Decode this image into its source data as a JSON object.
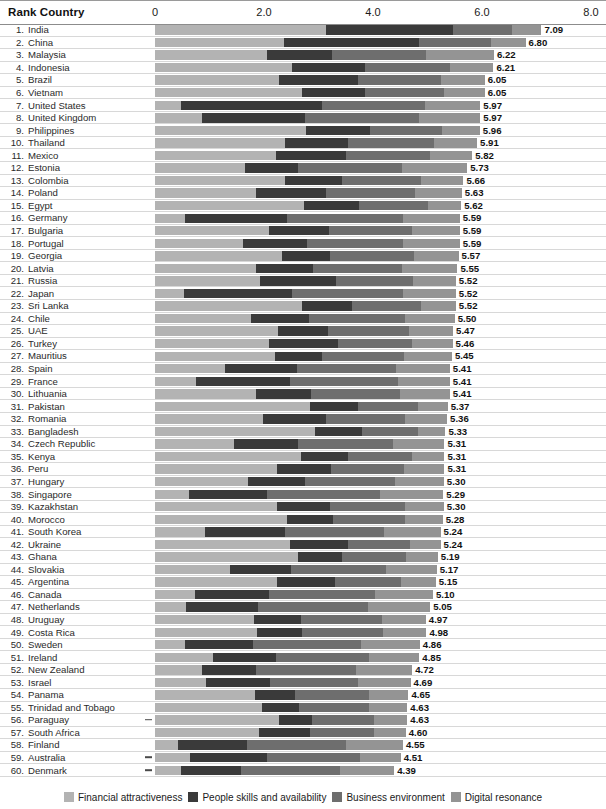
{
  "header": {
    "title": "Rank Country",
    "axis_ticks": [
      "0",
      "2.0",
      "4.0",
      "6.0",
      "8.0"
    ]
  },
  "legend": {
    "items": [
      {
        "label": "Financial attractiveness",
        "color": "#b3b3b3"
      },
      {
        "label": "People skills and availability",
        "color": "#3a3a3a"
      },
      {
        "label": "Business environment",
        "color": "#6e6e6e"
      },
      {
        "label": "Digital resonance",
        "color": "#949494"
      }
    ]
  },
  "chart_data": {
    "type": "bar",
    "title": "Rank Country",
    "subtitle": "",
    "xlabel": "",
    "ylabel": "",
    "orientation": "horizontal",
    "stacked": true,
    "xlim": [
      0,
      8.0
    ],
    "xticks": [
      0,
      2.0,
      4.0,
      6.0,
      8.0
    ],
    "grid": false,
    "legend_position": "bottom",
    "series": [
      {
        "name": "Financial attractiveness",
        "color": "#b3b3b3"
      },
      {
        "name": "People skills and availability",
        "color": "#3a3a3a"
      },
      {
        "name": "Business environment",
        "color": "#6e6e6e"
      },
      {
        "name": "Digital resonance",
        "color": "#949494"
      }
    ],
    "categories": [
      "India",
      "China",
      "Malaysia",
      "Indonesia",
      "Brazil",
      "Vietnam",
      "United States",
      "United Kingdom",
      "Philippines",
      "Thailand",
      "Mexico",
      "Estonia",
      "Colombia",
      "Poland",
      "Egypt",
      "Germany",
      "Bulgaria",
      "Portugal",
      "Georgia",
      "Latvia",
      "Russia",
      "Japan",
      "Sri Lanka",
      "Chile",
      "UAE",
      "Turkey",
      "Mauritius",
      "Spain",
      "France",
      "Lithuania",
      "Pakistan",
      "Romania",
      "Bangladesh",
      "Czech Republic",
      "Kenya",
      "Peru",
      "Hungary",
      "Singapore",
      "Kazakhstan",
      "Morocco",
      "South Korea",
      "Ukraine",
      "Ghana",
      "Slovakia",
      "Argentina",
      "Canada",
      "Netherlands",
      "Uruguay",
      "Costa Rica",
      "Sweden",
      "Ireland",
      "New Zealand",
      "Israel",
      "Panama",
      "Trinidad and Tobago",
      "Paraguay",
      "South Africa",
      "Finland",
      "Australia",
      "Denmark"
    ],
    "rows": [
      {
        "rank": 1,
        "country": "India",
        "total": "7.09",
        "segments": [
          3.13,
          2.33,
          1.09,
          0.54
        ],
        "negative": false
      },
      {
        "rank": 2,
        "country": "China",
        "total": "6.80",
        "segments": [
          2.37,
          2.48,
          1.31,
          0.64
        ],
        "negative": false
      },
      {
        "rank": 3,
        "country": "Malaysia",
        "total": "6.22",
        "segments": [
          2.06,
          1.19,
          1.73,
          1.24
        ],
        "negative": false
      },
      {
        "rank": 4,
        "country": "Indonesia",
        "total": "6.21",
        "segments": [
          2.51,
          1.35,
          1.55,
          0.8
        ],
        "negative": false
      },
      {
        "rank": 5,
        "country": "Brazil",
        "total": "6.05",
        "segments": [
          2.27,
          1.45,
          1.52,
          0.81
        ],
        "negative": false
      },
      {
        "rank": 6,
        "country": "Vietnam",
        "total": "6.05",
        "segments": [
          2.7,
          1.16,
          1.45,
          0.74
        ],
        "negative": false
      },
      {
        "rank": 7,
        "country": "United States",
        "total": "5.97",
        "segments": [
          0.47,
          2.6,
          1.89,
          1.01
        ],
        "negative": false
      },
      {
        "rank": 8,
        "country": "United Kingdom",
        "total": "5.97",
        "segments": [
          0.86,
          1.9,
          2.09,
          1.12
        ],
        "negative": false
      },
      {
        "rank": 9,
        "country": "Philippines",
        "total": "5.96",
        "segments": [
          2.77,
          1.17,
          1.32,
          0.7
        ],
        "negative": false
      },
      {
        "rank": 10,
        "country": "Thailand",
        "total": "5.91",
        "segments": [
          2.38,
          1.16,
          1.58,
          0.79
        ],
        "negative": false
      },
      {
        "rank": 11,
        "country": "Mexico",
        "total": "5.82",
        "segments": [
          2.22,
          1.29,
          1.53,
          0.78
        ],
        "negative": false
      },
      {
        "rank": 12,
        "country": "Estonia",
        "total": "5.73",
        "segments": [
          1.65,
          0.98,
          1.9,
          1.2
        ],
        "negative": false
      },
      {
        "rank": 13,
        "country": "Colombia",
        "total": "5.66",
        "segments": [
          2.39,
          1.05,
          1.44,
          0.78
        ],
        "negative": false
      },
      {
        "rank": 14,
        "country": "Poland",
        "total": "5.63",
        "segments": [
          1.85,
          1.29,
          1.63,
          0.86
        ],
        "negative": false
      },
      {
        "rank": 15,
        "country": "Egypt",
        "total": "5.62",
        "segments": [
          2.74,
          1.01,
          1.26,
          0.61
        ],
        "negative": false
      },
      {
        "rank": 16,
        "country": "Germany",
        "total": "5.59",
        "segments": [
          0.55,
          1.87,
          2.13,
          1.04
        ],
        "negative": false
      },
      {
        "rank": 17,
        "country": "Bulgaria",
        "total": "5.59",
        "segments": [
          2.1,
          1.09,
          1.53,
          0.87
        ],
        "negative": false
      },
      {
        "rank": 18,
        "country": "Portugal",
        "total": "5.59",
        "segments": [
          1.62,
          1.16,
          1.77,
          1.04
        ],
        "negative": false
      },
      {
        "rank": 19,
        "country": "Georgia",
        "total": "5.57",
        "segments": [
          2.33,
          0.88,
          1.55,
          0.81
        ],
        "negative": false
      },
      {
        "rank": 20,
        "country": "Latvia",
        "total": "5.55",
        "segments": [
          1.86,
          1.04,
          1.64,
          1.01
        ],
        "negative": false
      },
      {
        "rank": 21,
        "country": "Russia",
        "total": "5.52",
        "segments": [
          1.93,
          1.39,
          1.41,
          0.79
        ],
        "negative": false
      },
      {
        "rank": 22,
        "country": "Japan",
        "total": "5.52",
        "segments": [
          0.54,
          1.98,
          2.03,
          0.97
        ],
        "negative": false
      },
      {
        "rank": 23,
        "country": "Sri Lanka",
        "total": "5.52",
        "segments": [
          2.7,
          0.92,
          1.27,
          0.63
        ],
        "negative": false
      },
      {
        "rank": 24,
        "country": "Chile",
        "total": "5.50",
        "segments": [
          1.76,
          1.07,
          1.75,
          0.92
        ],
        "negative": false
      },
      {
        "rank": 25,
        "country": "UAE",
        "total": "5.47",
        "segments": [
          2.26,
          0.92,
          1.49,
          0.8
        ],
        "negative": false
      },
      {
        "rank": 26,
        "country": "Turkey",
        "total": "5.46",
        "segments": [
          2.09,
          1.26,
          1.37,
          0.74
        ],
        "negative": false
      },
      {
        "rank": 27,
        "country": "Mauritius",
        "total": "5.45",
        "segments": [
          2.21,
          0.85,
          1.51,
          0.88
        ],
        "negative": false
      },
      {
        "rank": 28,
        "country": "Spain",
        "total": "5.41",
        "segments": [
          1.29,
          1.32,
          1.82,
          0.98
        ],
        "negative": false
      },
      {
        "rank": 29,
        "country": "France",
        "total": "5.41",
        "segments": [
          0.75,
          1.73,
          1.98,
          0.95
        ],
        "negative": false
      },
      {
        "rank": 30,
        "country": "Lithuania",
        "total": "5.41",
        "segments": [
          1.85,
          1.02,
          1.62,
          0.92
        ],
        "negative": false
      },
      {
        "rank": 31,
        "country": "Pakistan",
        "total": "5.37",
        "segments": [
          2.84,
          0.89,
          1.1,
          0.54
        ],
        "negative": false
      },
      {
        "rank": 32,
        "country": "Romania",
        "total": "5.36",
        "segments": [
          1.98,
          1.16,
          1.44,
          0.78
        ],
        "negative": false
      },
      {
        "rank": 33,
        "country": "Bangladesh",
        "total": "5.33",
        "segments": [
          2.93,
          0.87,
          1.02,
          0.51
        ],
        "negative": false
      },
      {
        "rank": 34,
        "country": "Czech Republic",
        "total": "5.31",
        "segments": [
          1.45,
          1.18,
          1.73,
          0.95
        ],
        "negative": false
      },
      {
        "rank": 35,
        "country": "Kenya",
        "total": "5.31",
        "segments": [
          2.68,
          0.87,
          1.17,
          0.59
        ],
        "negative": false
      },
      {
        "rank": 36,
        "country": "Peru",
        "total": "5.31",
        "segments": [
          2.24,
          0.99,
          1.34,
          0.74
        ],
        "negative": false
      },
      {
        "rank": 37,
        "country": "Hungary",
        "total": "5.30",
        "segments": [
          1.7,
          1.06,
          1.64,
          0.9
        ],
        "negative": false
      },
      {
        "rank": 38,
        "country": "Singapore",
        "total": "5.29",
        "segments": [
          0.62,
          1.44,
          2.06,
          1.17
        ],
        "negative": false
      },
      {
        "rank": 39,
        "country": "Kazakhstan",
        "total": "5.30",
        "segments": [
          2.24,
          0.98,
          1.36,
          0.72
        ],
        "negative": false
      },
      {
        "rank": 40,
        "country": "Morocco",
        "total": "5.28",
        "segments": [
          2.43,
          0.84,
          1.31,
          0.7
        ],
        "negative": false
      },
      {
        "rank": 41,
        "country": "South Korea",
        "total": "5.24",
        "segments": [
          0.91,
          1.47,
          1.83,
          1.03
        ],
        "negative": false
      },
      {
        "rank": 42,
        "country": "Ukraine",
        "total": "5.24",
        "segments": [
          2.48,
          1.06,
          1.14,
          0.56
        ],
        "negative": false
      },
      {
        "rank": 43,
        "country": "Ghana",
        "total": "5.19",
        "segments": [
          2.63,
          0.8,
          1.17,
          0.59
        ],
        "negative": false
      },
      {
        "rank": 44,
        "country": "Slovakia",
        "total": "5.17",
        "segments": [
          1.38,
          1.12,
          1.74,
          0.93
        ],
        "negative": false
      },
      {
        "rank": 45,
        "country": "Argentina",
        "total": "5.15",
        "segments": [
          2.23,
          1.07,
          1.21,
          0.64
        ],
        "negative": false
      },
      {
        "rank": 46,
        "country": "Canada",
        "total": "5.10",
        "segments": [
          0.73,
          1.37,
          1.93,
          1.07
        ],
        "negative": false
      },
      {
        "rank": 47,
        "country": "Netherlands",
        "total": "5.05",
        "segments": [
          0.56,
          1.33,
          2.02,
          1.14
        ],
        "negative": false
      },
      {
        "rank": 48,
        "country": "Uruguay",
        "total": "4.97",
        "segments": [
          1.82,
          0.86,
          1.49,
          0.8
        ],
        "negative": false
      },
      {
        "rank": 49,
        "country": "Costa Rica",
        "total": "4.98",
        "segments": [
          1.88,
          0.81,
          1.49,
          0.8
        ],
        "negative": false
      },
      {
        "rank": 50,
        "country": "Sweden",
        "total": "4.86",
        "segments": [
          0.55,
          1.25,
          1.98,
          1.08
        ],
        "negative": false
      },
      {
        "rank": 51,
        "country": "Ireland",
        "total": "4.85",
        "segments": [
          1.07,
          1.15,
          1.7,
          0.93
        ],
        "negative": false
      },
      {
        "rank": 52,
        "country": "New Zealand",
        "total": "4.72",
        "segments": [
          0.86,
          0.99,
          1.84,
          1.03
        ],
        "negative": false
      },
      {
        "rank": 53,
        "country": "Israel",
        "total": "4.69",
        "segments": [
          0.93,
          1.18,
          1.62,
          0.96
        ],
        "negative": false
      },
      {
        "rank": 54,
        "country": "Panama",
        "total": "4.65",
        "segments": [
          1.84,
          0.72,
          1.36,
          0.73
        ],
        "negative": false
      },
      {
        "rank": 55,
        "country": "Trinidad and Tobago",
        "total": "4.63",
        "segments": [
          1.96,
          0.68,
          1.28,
          0.71
        ],
        "negative": false
      },
      {
        "rank": 56,
        "country": "Paraguay",
        "total": "4.63",
        "segments": [
          2.27,
          0.62,
          1.12,
          0.62
        ],
        "negative": true
      },
      {
        "rank": 57,
        "country": "South Africa",
        "total": "4.60",
        "segments": [
          1.9,
          0.95,
          1.17,
          0.58
        ],
        "negative": false
      },
      {
        "rank": 58,
        "country": "Finland",
        "total": "4.55",
        "segments": [
          0.42,
          1.26,
          1.82,
          1.05
        ],
        "negative": false
      },
      {
        "rank": 59,
        "country": "Australia",
        "total": "4.51",
        "segments": [
          0.64,
          1.42,
          1.71,
          0.74
        ],
        "negative": true
      },
      {
        "rank": 60,
        "country": "Denmark",
        "total": "4.39",
        "segments": [
          0.47,
          1.1,
          1.82,
          1.0
        ],
        "negative": true
      }
    ]
  }
}
